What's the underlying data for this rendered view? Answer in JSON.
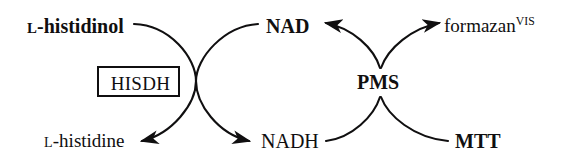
{
  "diagram": {
    "type": "reaction-scheme",
    "stroke_color": "#100f10",
    "background_color": "#ffffff",
    "nodes": {
      "substrate_in": {
        "prefix": "L",
        "text": "-histidinol",
        "weight": "bold"
      },
      "product_out": {
        "prefix": "L",
        "text": "-histidine",
        "weight": "regular"
      },
      "cofactor_ox": {
        "text": "NAD",
        "weight": "bold"
      },
      "cofactor_red": {
        "text": "NADH",
        "weight": "regular"
      },
      "enzyme": {
        "text": "HISDH",
        "weight": "regular"
      },
      "mediator": {
        "text": "PMS",
        "weight": "bold"
      },
      "dye_in": {
        "text": "MTT",
        "weight": "bold"
      },
      "dye_out": {
        "text": "formazan",
        "superscript": "VIS",
        "weight": "regular"
      }
    },
    "arrows": [
      {
        "name": "histidinol-to-histidine",
        "from": "L-histidinol",
        "to": "L-histidine",
        "head": "left"
      },
      {
        "name": "nad-to-nadh",
        "from": "NAD",
        "to": "NADH",
        "head": "right"
      },
      {
        "name": "pms-to-nad",
        "from": "PMS",
        "to": "NAD",
        "head": "left"
      },
      {
        "name": "pms-to-formazan",
        "from": "PMS",
        "to": "formazan",
        "head": "right"
      },
      {
        "name": "nadh-to-pms",
        "from": "NADH",
        "to": "PMS",
        "head": "none"
      },
      {
        "name": "mtt-to-pms",
        "from": "MTT",
        "to": "PMS",
        "head": "none"
      }
    ]
  }
}
